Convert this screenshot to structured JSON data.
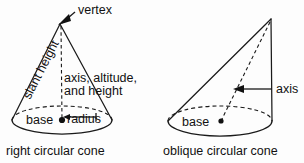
{
  "figure": {
    "title": "",
    "background_color": "#fdfdfd",
    "stroke_color": "#1a1a1a",
    "text_color": "#111111"
  },
  "right_cone": {
    "caption": "right circular cone",
    "labels": {
      "vertex": "vertex",
      "slant_height": "slant height",
      "axis_line1": "axis, altitude,",
      "axis_line2": "and height",
      "base": "base",
      "radius": "radius"
    },
    "geometry": {
      "apex_x": 60,
      "apex_y": 24,
      "base_center_x": 62,
      "base_center_y": 120,
      "base_rx": 50,
      "base_ry": 14
    }
  },
  "oblique_cone": {
    "caption": "oblique circular cone",
    "labels": {
      "axis": "axis",
      "base": "base"
    },
    "geometry": {
      "apex_x": 271,
      "apex_y": 19,
      "base_center_x": 220,
      "base_center_y": 121,
      "base_rx": 52,
      "base_ry": 15
    }
  }
}
